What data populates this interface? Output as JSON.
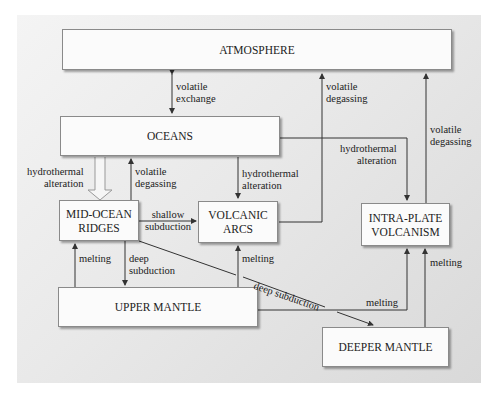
{
  "diagram": {
    "nodes": {
      "atmosphere": "ATMOSPHERE",
      "oceans": "OCEANS",
      "mid_ocean_ridges_1": "MID-OCEAN",
      "mid_ocean_ridges_2": "RIDGES",
      "volcanic_arcs_1": "VOLCANIC",
      "volcanic_arcs_2": "ARCS",
      "intra_plate_1": "INTRA-PLATE",
      "intra_plate_2": "VOLCANISM",
      "upper_mantle": "UPPER MANTLE",
      "deeper_mantle": "DEEPER MANTLE"
    },
    "edges": {
      "ocean_atm_1": "volatile",
      "ocean_atm_2": "exchange",
      "arcs_atm_1": "volatile",
      "arcs_atm_2": "degassing",
      "intra_atm_1": "volatile",
      "intra_atm_2": "degassing",
      "oceans_ridges_hydro_1": "hydrothermal",
      "oceans_ridges_hydro_2": "alteration",
      "ridges_oceans_1": "volatile",
      "ridges_oceans_2": "degassing",
      "oceans_arcs_1": "hydrothermal",
      "oceans_arcs_2": "alteration",
      "oceans_intra_1": "hydrothermal",
      "oceans_intra_2": "alteration",
      "ridges_arcs_1": "shallow",
      "ridges_arcs_2": "subduction",
      "upper_ridges": "melting",
      "ridges_upper_1": "deep",
      "ridges_upper_2": "subduction",
      "upper_arcs": "melting",
      "ridges_deeper": "deep subduction",
      "upper_intra": "melting",
      "deeper_intra": "melting"
    },
    "colors": {
      "line": "#333333",
      "box_fill": "#fbfbfb",
      "panel_light": "#f4f4f4",
      "panel_dark": "#d9d9d9"
    }
  }
}
